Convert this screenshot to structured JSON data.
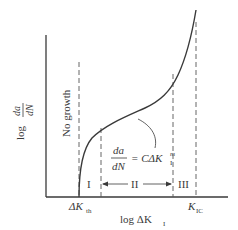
{
  "diagram": {
    "type": "fatigue-crack-growth-curve",
    "y_axis_label": {
      "prefix": "log",
      "numerator": "da",
      "denominator": "dN"
    },
    "x_axis_label": {
      "prefix": "log ΔK",
      "subscript": "I"
    },
    "threshold_label": {
      "main": "ΔK",
      "subscript": "th"
    },
    "critical_label": {
      "main": "K",
      "subscript": "IC"
    },
    "no_growth_label": "No growth",
    "equation": {
      "numerator": "da",
      "denominator": "dN",
      "rhs_main": "= CΔK",
      "rhs_subscript": "I",
      "rhs_superscript": "m"
    },
    "regions": [
      {
        "label": "I"
      },
      {
        "label": "II"
      },
      {
        "label": "III"
      }
    ],
    "colors": {
      "curve": "#3a3a3a",
      "axes": "#3a3a3a",
      "dashed": "#555555",
      "background": "#ffffff"
    }
  }
}
